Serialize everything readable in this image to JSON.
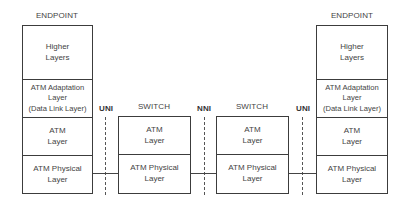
{
  "diagram": {
    "nodes": [
      {
        "title": "ENDPOINT",
        "layers": [
          "Higher\nLayers",
          "ATM Adaptation\nLayer\n(Data Link Layer)",
          "ATM\nLayer",
          "ATM Physical\nLayer"
        ]
      },
      {
        "title": "SWITCH",
        "layers": [
          "ATM\nLayer",
          "ATM Physical\nLayer"
        ]
      },
      {
        "title": "SWITCH",
        "layers": [
          "ATM\nLayer",
          "ATM Physical\nLayer"
        ]
      },
      {
        "title": "ENDPOINT",
        "layers": [
          "Higher\nLayers",
          "ATM Adaptation\nLayer\n(Data Link Layer)",
          "ATM\nLayer",
          "ATM Physical\nLayer"
        ]
      }
    ],
    "interfaces": [
      "UNI",
      "NNI",
      "UNI"
    ]
  }
}
